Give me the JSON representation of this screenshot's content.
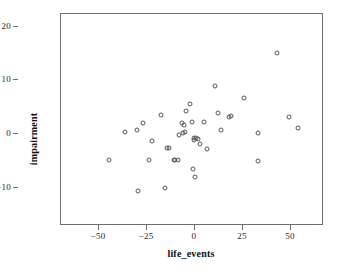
{
  "chart_data": {
    "type": "scatter",
    "title": "",
    "xlabel": "life_events",
    "ylabel": "impairment",
    "xlim": [
      -65,
      72
    ],
    "ylim": [
      -15.5,
      22
    ],
    "xticks": [
      -50,
      -25,
      0,
      25,
      50
    ],
    "xticklabels": [
      "−50",
      "−25",
      "0",
      "25",
      "50"
    ],
    "yticks": [
      -10,
      0,
      10,
      20
    ],
    "yticklabels": [
      "−10",
      "0",
      "10",
      "20"
    ],
    "grid": false,
    "legend": null,
    "marker": "open-circle",
    "marker_color": "#54545e",
    "points": [
      {
        "x": -44.8,
        "y": -4.8
      },
      {
        "x": -36.5,
        "y": 0.4
      },
      {
        "x": -30.2,
        "y": 0.7
      },
      {
        "x": -29.7,
        "y": -10.7
      },
      {
        "x": -27.1,
        "y": 2.0
      },
      {
        "x": -24.0,
        "y": -4.8
      },
      {
        "x": -22.4,
        "y": -1.3
      },
      {
        "x": -17.7,
        "y": 3.5
      },
      {
        "x": -15.6,
        "y": -10.1
      },
      {
        "x": -14.6,
        "y": -2.6
      },
      {
        "x": -13.5,
        "y": -2.6
      },
      {
        "x": -10.9,
        "y": -4.8
      },
      {
        "x": -10.4,
        "y": -4.9
      },
      {
        "x": -8.9,
        "y": -4.8
      },
      {
        "x": -6.8,
        "y": 2.1
      },
      {
        "x": -5.7,
        "y": 1.7
      },
      {
        "x": -4.7,
        "y": 4.2
      },
      {
        "x": -2.6,
        "y": 5.5
      },
      {
        "x": -8.3,
        "y": -0.2
      },
      {
        "x": -6.2,
        "y": 0.1
      },
      {
        "x": -5.2,
        "y": 0.4
      },
      {
        "x": -1.6,
        "y": 2.2
      },
      {
        "x": -0.5,
        "y": -0.7
      },
      {
        "x": 0.5,
        "y": -0.8
      },
      {
        "x": -0.6,
        "y": -1.2
      },
      {
        "x": 1.6,
        "y": -0.9
      },
      {
        "x": 2.6,
        "y": -1.9
      },
      {
        "x": 6.2,
        "y": -2.8
      },
      {
        "x": -1.0,
        "y": -6.5
      },
      {
        "x": 0.0,
        "y": -8.0
      },
      {
        "x": 4.7,
        "y": 2.2
      },
      {
        "x": 10.4,
        "y": 9.0
      },
      {
        "x": 12.0,
        "y": 3.9
      },
      {
        "x": 13.5,
        "y": 0.7
      },
      {
        "x": 17.7,
        "y": 3.2
      },
      {
        "x": 18.8,
        "y": 3.3
      },
      {
        "x": 25.5,
        "y": 6.7
      },
      {
        "x": 32.8,
        "y": 0.2
      },
      {
        "x": 32.8,
        "y": -5.1
      },
      {
        "x": 42.7,
        "y": 15.1
      },
      {
        "x": 49.0,
        "y": 3.2
      },
      {
        "x": 53.6,
        "y": 1.2
      }
    ]
  }
}
